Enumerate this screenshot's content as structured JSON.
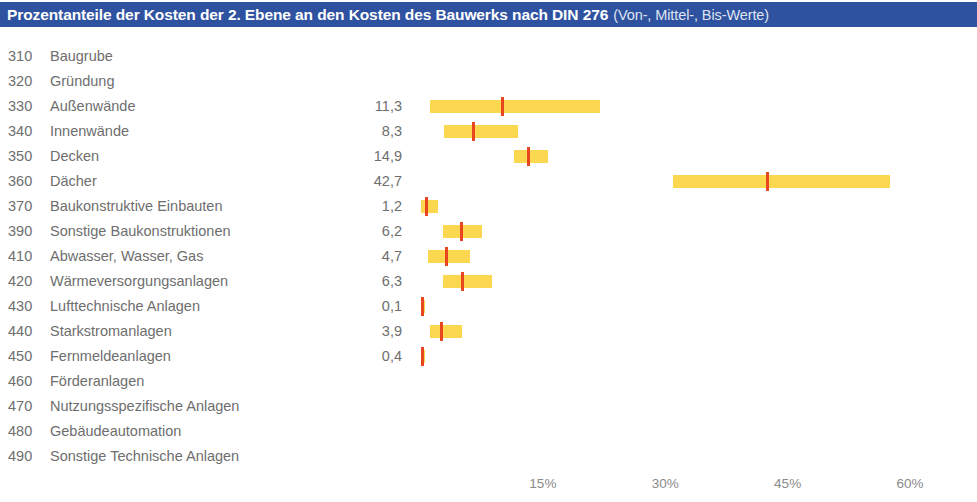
{
  "title": {
    "main": "Prozentanteile der Kosten der 2. Ebene an den Kosten des Bauwerks nach DIN 276",
    "sub": "(Von-, Mittel-, Bis-Werte)"
  },
  "colors": {
    "title_band": "#2f52a0",
    "title_text": "#ffffff",
    "title_sub_text": "#dfe4f2",
    "range_bar": "#fcd850",
    "mid_marker": "#e8461e",
    "label_text": "#6e6e6e",
    "axis_text": "#8a8a8a",
    "background": "#ffffff"
  },
  "chart_data": {
    "type": "bar",
    "subtype": "range-with-midpoint",
    "title": "Prozentanteile der Kosten der 2. Ebene an den Kosten des Bauwerks nach DIN 276 (Von-, Mittel-, Bis-Werte)",
    "xlabel": "",
    "ylabel": "",
    "xlim": [
      0,
      62
    ],
    "xticks": [
      15,
      30,
      45,
      60
    ],
    "xtick_labels": [
      "15%",
      "30%",
      "45%",
      "60%"
    ],
    "grid": false,
    "legend": null,
    "value_label_note": "Displayed value is the Mittel- (mean) value in percent; bar spans Von- to Bis-Wert",
    "categories": [
      "310 Baugrube",
      "320 Gründung",
      "330 Außenwände",
      "340 Innenwände",
      "350 Decken",
      "360 Dächer",
      "370 Baukonstruktive Einbauten",
      "390 Sonstige Baukonstruktionen",
      "410 Abwasser, Wasser, Gas",
      "420 Wärmeversorgungsanlagen",
      "430 Lufttechnische Anlagen",
      "440 Starkstromanlagen",
      "450 Fernmeldeanlagen",
      "460 Förderanlagen",
      "470 Nutzungsspezifische Anlagen",
      "480 Gebäudeautomation",
      "490 Sonstige Technische Anlagen"
    ],
    "rows": [
      {
        "code": "310",
        "label": "Baugrube",
        "value": "",
        "von": null,
        "mittel": null,
        "bis": null
      },
      {
        "code": "320",
        "label": "Gründung",
        "value": "",
        "von": null,
        "mittel": null,
        "bis": null
      },
      {
        "code": "330",
        "label": "Außenwände",
        "value": "11,3",
        "von": 1.2,
        "mittel": 10.0,
        "bis": 22.0
      },
      {
        "code": "340",
        "label": "Innenwände",
        "value": "8,3",
        "von": 2.9,
        "mittel": 6.5,
        "bis": 11.9
      },
      {
        "code": "350",
        "label": "Decken",
        "value": "14,9",
        "von": 11.5,
        "mittel": 13.2,
        "bis": 15.6
      },
      {
        "code": "360",
        "label": "Dächer",
        "value": "42,7",
        "von": 31.0,
        "mittel": 42.5,
        "bis": 57.6
      },
      {
        "code": "370",
        "label": "Baukonstruktive Einbauten",
        "value": "1,2",
        "von": 0.0,
        "mittel": 0.7,
        "bis": 2.2
      },
      {
        "code": "390",
        "label": "Sonstige Baukonstruktionen",
        "value": "6,2",
        "von": 2.8,
        "mittel": 5.0,
        "bis": 7.6
      },
      {
        "code": "410",
        "label": "Abwasser, Wasser, Gas",
        "value": "4,7",
        "von": 0.9,
        "mittel": 3.2,
        "bis": 6.1
      },
      {
        "code": "420",
        "label": "Wärmeversorgungsanlagen",
        "value": "6,3",
        "von": 2.7,
        "mittel": 5.1,
        "bis": 8.8
      },
      {
        "code": "430",
        "label": "Lufttechnische Anlagen",
        "value": "0,1",
        "von": 0.0,
        "mittel": 0.2,
        "bis": 0.4
      },
      {
        "code": "440",
        "label": "Starkstromanlagen",
        "value": "3,9",
        "von": 1.2,
        "mittel": 2.6,
        "bis": 5.1
      },
      {
        "code": "450",
        "label": "Fernmeldeanlagen",
        "value": "0,4",
        "von": 0.0,
        "mittel": 0.2,
        "bis": 0.4
      },
      {
        "code": "460",
        "label": "Förderanlagen",
        "value": "",
        "von": null,
        "mittel": null,
        "bis": null
      },
      {
        "code": "470",
        "label": "Nutzungsspezifische Anlagen",
        "value": "",
        "von": null,
        "mittel": null,
        "bis": null
      },
      {
        "code": "480",
        "label": "Gebäudeautomation",
        "value": "",
        "von": null,
        "mittel": null,
        "bis": null
      },
      {
        "code": "490",
        "label": "Sonstige Technische Anlagen",
        "value": "",
        "von": null,
        "mittel": null,
        "bis": null
      }
    ]
  },
  "axis": {
    "ticks": [
      {
        "label": "15%",
        "value": 15
      },
      {
        "label": "30%",
        "value": 30
      },
      {
        "label": "45%",
        "value": 45
      },
      {
        "label": "60%",
        "value": 60
      }
    ]
  }
}
